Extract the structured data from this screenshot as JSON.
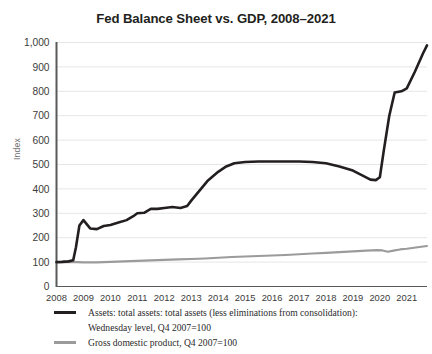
{
  "chart_data": {
    "type": "line",
    "title": "Fed Balance Sheet vs. GDP, 2008–2021",
    "xlabel": "",
    "ylabel": "Index",
    "ylim": [
      0,
      1000
    ],
    "ytick_step": 100,
    "grid": true,
    "grid_axis": "y",
    "legend_position": "below",
    "xlim": [
      2008,
      2021.75
    ],
    "categories": [
      "2008",
      "2009",
      "2010",
      "2011",
      "2012",
      "2013",
      "2014",
      "2015",
      "2016",
      "2017",
      "2018",
      "2019",
      "2020",
      "2021"
    ],
    "yticks": [
      "0",
      "100",
      "200",
      "300",
      "400",
      "500",
      "600",
      "700",
      "800",
      "900",
      "1,000"
    ],
    "series": [
      {
        "name": "Assets: total assets: total assets (less eliminations from consolidation): Wednesday level, Q4 2007=100",
        "color": "#231f20",
        "x": [
          2008.0,
          2008.2,
          2008.45,
          2008.62,
          2008.72,
          2008.85,
          2009.0,
          2009.25,
          2009.5,
          2009.75,
          2010.0,
          2010.3,
          2010.6,
          2010.85,
          2011.0,
          2011.25,
          2011.5,
          2011.75,
          2012.0,
          2012.3,
          2012.6,
          2012.85,
          2013.0,
          2013.3,
          2013.6,
          2014.0,
          2014.3,
          2014.6,
          2015.0,
          2015.5,
          2016.0,
          2016.5,
          2017.0,
          2017.5,
          2018.0,
          2018.5,
          2019.0,
          2019.4,
          2019.65,
          2019.85,
          2020.0,
          2020.15,
          2020.35,
          2020.55,
          2020.8,
          2021.0,
          2021.3,
          2021.6,
          2021.75
        ],
        "values": [
          100,
          101,
          103,
          108,
          160,
          250,
          272,
          238,
          235,
          248,
          252,
          262,
          272,
          288,
          300,
          302,
          318,
          318,
          322,
          326,
          322,
          330,
          352,
          392,
          432,
          470,
          492,
          505,
          510,
          512,
          512,
          512,
          512,
          510,
          505,
          492,
          475,
          452,
          438,
          436,
          448,
          560,
          700,
          795,
          800,
          812,
          880,
          955,
          988
        ]
      },
      {
        "name": "Gross domestic product, Q4 2007=100",
        "color": "#9b9b9b",
        "x": [
          2008.0,
          2008.5,
          2009.0,
          2009.5,
          2010.0,
          2010.5,
          2011.0,
          2011.5,
          2012.0,
          2012.5,
          2013.0,
          2013.5,
          2014.0,
          2014.5,
          2015.0,
          2015.5,
          2016.0,
          2016.5,
          2017.0,
          2017.5,
          2018.0,
          2018.5,
          2019.0,
          2019.5,
          2019.9,
          2020.1,
          2020.3,
          2020.5,
          2020.75,
          2021.0,
          2021.4,
          2021.75
        ],
        "values": [
          100,
          101,
          99,
          99,
          101,
          103,
          105,
          107,
          109,
          111,
          113,
          115,
          118,
          121,
          123,
          125,
          127,
          129,
          132,
          135,
          138,
          141,
          144,
          147,
          149,
          148,
          142,
          147,
          152,
          155,
          161,
          166
        ]
      }
    ]
  },
  "legend": {
    "entries": [
      {
        "swatch": "assets-line-swatch",
        "lines": [
          "Assets: total assets: total assets (less eliminations from consolidation):",
          "Wednesday level, Q4 2007=100"
        ]
      },
      {
        "swatch": "gdp-line-swatch",
        "lines": [
          "Gross domestic product, Q4 2007=100"
        ]
      }
    ]
  },
  "colors": {
    "assets_line": "#231f20",
    "gdp_line": "#9b9b9b",
    "gridline": "#e6e6e6",
    "axis": "#595959",
    "title_text": "#231f20",
    "tick_text": "#3b3b3b",
    "axis_title_text": "#6e6e6e",
    "background": "#ffffff"
  }
}
